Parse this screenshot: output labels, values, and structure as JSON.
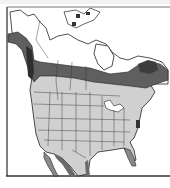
{
  "map": {
    "title": "Range map of North America",
    "region": "North America",
    "legend": [
      {
        "name": "breeding-range",
        "color": "#5f5f5f"
      },
      {
        "name": "winter-range",
        "color": "#cfcfcf"
      },
      {
        "name": "land-no-range",
        "color": "#ffffff"
      }
    ],
    "colors": {
      "border_lines": "#222222",
      "frame": "#444444",
      "water": "#ffffff"
    }
  }
}
